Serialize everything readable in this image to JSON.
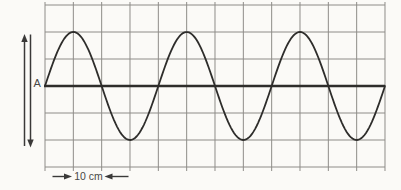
{
  "figure": {
    "type": "transverse-wave-on-grid",
    "labels": {
      "amplitude": "A",
      "scale": "10 cm"
    },
    "wave": {
      "shape": "sine",
      "cycles": 3,
      "wavelength_squares": 4,
      "amplitude_squares": 2,
      "starts_at": "equilibrium-rising"
    },
    "grid": {
      "columns": 12,
      "rows": 6
    },
    "colors": {
      "background": "#fbfaf7",
      "grid_line": "#8e8c88",
      "wave_line": "#2e2d2b",
      "equilibrium_line": "#2e2d2b",
      "annotation": "#3a3938",
      "label_text": "#4a4846"
    }
  }
}
